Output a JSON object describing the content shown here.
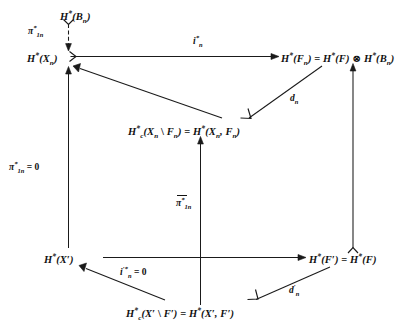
{
  "figure": {
    "kind": "commutative-diagram",
    "background_color": "#ffffff",
    "ink_color": "#1a1a1a"
  },
  "nodes": {
    "top_base": {
      "id": "H-star-B-n",
      "text": "H*(Bₙ)",
      "x": 60,
      "y": 8
    },
    "upper_left": {
      "id": "H-star-X-n",
      "text": "H*(Xₙ)",
      "x": 27,
      "y": 52
    },
    "upper_right": {
      "id": "H-star-F-n-tensor",
      "text": "H*(Fₙ) = H*(F) ⊗ H*(Bₙ)",
      "x": 281,
      "y": 52
    },
    "middle": {
      "id": "H-c-star-X-n-minus-F-n",
      "text": "H*c(Xₙ \\ Fₙ) = H*(Xₙ, Fₙ)",
      "x": 200,
      "y": 130
    },
    "lower_left": {
      "id": "H-star-X-prime",
      "text": "H*(X′)",
      "x": 70,
      "y": 253
    },
    "lower_right": {
      "id": "H-star-F-prime",
      "text": "H*(F′) = H*(F)",
      "x": 352,
      "y": 253
    },
    "bottom": {
      "id": "H-c-star-X-prime-minus-F-prime",
      "text": "H*c(X′ \\ F′) = H*(X′, F′)",
      "x": 200,
      "y": 312
    }
  },
  "arrow_labels": {
    "pi_1n_star": {
      "id": "pi-1n-star",
      "text": "π*₁ₙ",
      "x": 31,
      "y": 26,
      "describes": "vertical arrow H*(B_n) to H*(X_n)"
    },
    "i_n_star": {
      "id": "i-n-star",
      "text": "i*ₙ",
      "x": 198,
      "y": 36,
      "describes": "horizontal arrow H*(X_n) to H*(F_n)"
    },
    "d_n": {
      "id": "d-n",
      "text": "dₙ",
      "x": 296,
      "y": 100,
      "describes": "diagonal arrow H*(F_n) to H*c(X_n minus F_n)"
    },
    "pi_1n_star_zero": {
      "id": "pi-1n-star-equals-zero",
      "text": "π*₁ₙ = 0",
      "x": 11,
      "y": 162,
      "describes": "left vertical arrow H*(X') to H*(X_n)"
    },
    "pi_bar_1n_star": {
      "id": "pi-bar-1n-star",
      "text": "π̄*₁ₙ",
      "x": 196,
      "y": 199,
      "describes": "center vertical arrow bottom node to middle node"
    },
    "i_n_prime_star_zero": {
      "id": "i-n-prime-star-equals-zero",
      "text": "i′*ₙ = 0",
      "x": 126,
      "y": 269,
      "describes": "horizontal arrow H*(X') to H*(F')"
    },
    "d_n_prime": {
      "id": "d-n-prime",
      "text": "d′ₙ",
      "x": 296,
      "y": 288,
      "describes": "diagonal arrow H*(F') to H*c(X' minus F')"
    }
  },
  "arrows": [
    {
      "id": "arrow-Bn-to-Xn",
      "from": "H-star-B-n",
      "to": "H-star-X-n",
      "style": "dashed-with-hook-tail",
      "direction": "down"
    },
    {
      "id": "arrow-Xn-to-Fn",
      "from": "H-star-X-n",
      "to": "H-star-F-n-tensor",
      "style": "mono-tail",
      "direction": "right"
    },
    {
      "id": "arrow-Fn-to-middle",
      "from": "H-star-F-n-tensor",
      "to": "H-c-star-X-n-minus-F-n",
      "style": "solid",
      "direction": "down-left"
    },
    {
      "id": "arrow-middle-to-Xn",
      "from": "H-c-star-X-n-minus-F-n",
      "to": "H-star-X-n",
      "style": "solid",
      "direction": "up-left"
    },
    {
      "id": "arrow-Xprime-to-Xn",
      "from": "H-star-X-prime",
      "to": "H-star-X-n",
      "style": "solid",
      "direction": "up"
    },
    {
      "id": "arrow-bottom-to-middle",
      "from": "H-c-star-X-prime-minus-F-prime",
      "to": "H-c-star-X-n-minus-F-n",
      "style": "solid",
      "direction": "up"
    },
    {
      "id": "arrow-Fprime-to-Fn",
      "from": "H-star-F-prime",
      "to": "H-star-F-n-tensor",
      "style": "solid",
      "direction": "up"
    },
    {
      "id": "arrow-Xprime-to-Fprime",
      "from": "H-star-X-prime",
      "to": "H-star-F-prime",
      "style": "solid",
      "direction": "right"
    },
    {
      "id": "arrow-Fprime-to-bottom",
      "from": "H-star-F-prime",
      "to": "H-c-star-X-prime-minus-F-prime",
      "style": "solid",
      "direction": "down-left"
    },
    {
      "id": "arrow-bottom-to-Xprime",
      "from": "H-c-star-X-prime-minus-F-prime",
      "to": "H-star-X-prime",
      "style": "solid",
      "direction": "up-left"
    }
  ]
}
